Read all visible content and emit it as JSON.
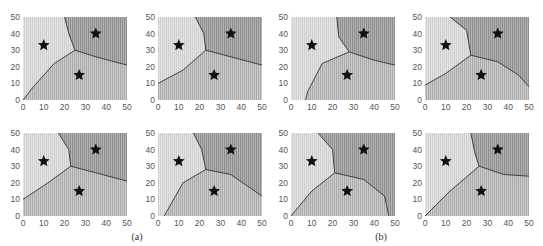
{
  "figure": {
    "captions": [
      "(a)",
      "(b)"
    ],
    "axis": {
      "xlim": [
        0,
        50
      ],
      "ylim": [
        0,
        50
      ],
      "xticks": [
        "0",
        "10",
        "20",
        "30",
        "40",
        "50"
      ],
      "yticks": [
        "0",
        "10",
        "20",
        "30",
        "40",
        "50"
      ]
    },
    "colors": {
      "region_left": "#dcdcdc",
      "region_bottom": "#c2c2c2",
      "region_top_right": "#a8a8a8",
      "boundary": "#333333",
      "star": "#111111"
    }
  },
  "chart_data": {
    "type": "heatmap",
    "xlabel": "",
    "ylabel": "",
    "xlim": [
      0,
      50
    ],
    "ylim": [
      0,
      50
    ],
    "grid": false,
    "legend": null,
    "sites": [
      [
        10,
        33
      ],
      [
        35,
        40
      ],
      [
        27,
        15
      ]
    ],
    "panels": [
      {
        "row": 0,
        "col": 0,
        "group": "(a)",
        "junction": [
          25,
          30
        ],
        "boundaries": {
          "left_top": [
            [
              20,
              50
            ],
            [
              22,
              40
            ],
            [
              25,
              30
            ]
          ],
          "left_bottom": [
            [
              25,
              30
            ],
            [
              15,
              22
            ],
            [
              5,
              8
            ],
            [
              0,
              0
            ]
          ],
          "top_bottom": [
            [
              25,
              30
            ],
            [
              35,
              26
            ],
            [
              50,
              21
            ]
          ]
        }
      },
      {
        "row": 0,
        "col": 1,
        "group": "(a)",
        "junction": [
          23,
          30
        ],
        "boundaries": {
          "left_top": [
            [
              18,
              50
            ],
            [
              22,
              40
            ],
            [
              23,
              30
            ]
          ],
          "left_bottom": [
            [
              23,
              30
            ],
            [
              12,
              18
            ],
            [
              0,
              10
            ]
          ],
          "top_bottom": [
            [
              23,
              30
            ],
            [
              35,
              26
            ],
            [
              50,
              21
            ]
          ]
        }
      },
      {
        "row": 0,
        "col": 2,
        "group": "(b)",
        "junction": [
          28,
          29
        ],
        "boundaries": {
          "left_top": [
            [
              22,
              50
            ],
            [
              23,
              38
            ],
            [
              28,
              29
            ]
          ],
          "left_bottom": [
            [
              28,
              29
            ],
            [
              15,
              22
            ],
            [
              8,
              5
            ],
            [
              7,
              0
            ]
          ],
          "top_bottom": [
            [
              28,
              29
            ],
            [
              40,
              24
            ],
            [
              50,
              21
            ]
          ]
        }
      },
      {
        "row": 0,
        "col": 3,
        "group": "(b)",
        "junction": [
          22,
          27
        ],
        "boundaries": {
          "left_top": [
            [
              12,
              50
            ],
            [
              20,
              42
            ],
            [
              22,
              27
            ]
          ],
          "left_bottom": [
            [
              22,
              27
            ],
            [
              10,
              16
            ],
            [
              0,
              9
            ]
          ],
          "top_bottom": [
            [
              22,
              27
            ],
            [
              35,
              23
            ],
            [
              45,
              15
            ],
            [
              50,
              8
            ]
          ]
        }
      },
      {
        "row": 1,
        "col": 0,
        "group": "(a)",
        "junction": [
          23,
          30
        ],
        "boundaries": {
          "left_top": [
            [
              17,
              50
            ],
            [
              22,
              40
            ],
            [
              23,
              30
            ]
          ],
          "left_bottom": [
            [
              23,
              30
            ],
            [
              12,
              20
            ],
            [
              0,
              10
            ]
          ],
          "top_bottom": [
            [
              23,
              30
            ],
            [
              35,
              26
            ],
            [
              50,
              21
            ]
          ]
        }
      },
      {
        "row": 1,
        "col": 1,
        "group": "(a)",
        "junction": [
          23,
          28
        ],
        "boundaries": {
          "left_top": [
            [
              17,
              50
            ],
            [
              21,
              40
            ],
            [
              23,
              28
            ]
          ],
          "left_bottom": [
            [
              23,
              28
            ],
            [
              12,
              20
            ],
            [
              3,
              0
            ]
          ],
          "top_bottom": [
            [
              23,
              28
            ],
            [
              35,
              25
            ],
            [
              50,
              12
            ]
          ]
        }
      },
      {
        "row": 1,
        "col": 2,
        "group": "(b)",
        "junction": [
          21,
          26
        ],
        "boundaries": {
          "left_top": [
            [
              13,
              50
            ],
            [
              20,
              40
            ],
            [
              21,
              26
            ]
          ],
          "left_bottom": [
            [
              21,
              26
            ],
            [
              10,
              15
            ],
            [
              0,
              0
            ]
          ],
          "top_bottom": [
            [
              21,
              26
            ],
            [
              35,
              22
            ],
            [
              45,
              12
            ],
            [
              47,
              0
            ]
          ]
        }
      },
      {
        "row": 1,
        "col": 3,
        "group": "(b)",
        "junction": [
          26,
          30
        ],
        "boundaries": {
          "left_top": [
            [
              22,
              50
            ],
            [
              24,
              38
            ],
            [
              26,
              30
            ]
          ],
          "left_bottom": [
            [
              26,
              30
            ],
            [
              12,
              15
            ],
            [
              0,
              0
            ]
          ],
          "top_bottom": [
            [
              26,
              30
            ],
            [
              38,
              25
            ],
            [
              50,
              24
            ]
          ]
        }
      }
    ],
    "annotations": [
      "(a)",
      "(b)"
    ]
  }
}
